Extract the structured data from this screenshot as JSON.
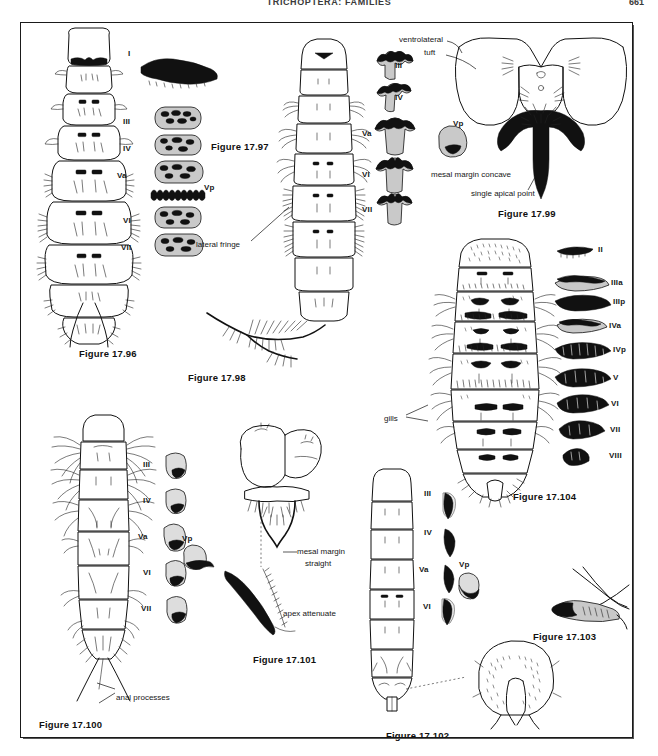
{
  "page": {
    "running_head": "TRICHOPTERA: FAMILIES",
    "folio": "661"
  },
  "figures": [
    {
      "id": "f1796",
      "label": "Figure 17.96"
    },
    {
      "id": "f1797",
      "label": "Figure 17.97"
    },
    {
      "id": "f1798",
      "label": "Figure 17.98"
    },
    {
      "id": "f1799",
      "label": "Figure 17.99"
    },
    {
      "id": "f17100",
      "label": "Figure 17.100"
    },
    {
      "id": "f17101",
      "label": "Figure 17.101"
    },
    {
      "id": "f17102",
      "label": "Figure 17.102"
    },
    {
      "id": "f17103",
      "label": "Figure 17.103"
    },
    {
      "id": "f17104",
      "label": "Figure 17.104"
    }
  ],
  "plate_1796": {
    "figure_label": "Figure 17.96",
    "segment_labels": [
      "I",
      "III",
      "IV",
      "Va",
      "Vp",
      "VI",
      "VII"
    ]
  },
  "plate_1797": {
    "figure_label": "Figure 17.97",
    "callout_lateral_fringe": "lateral fringe",
    "segment_labels": [
      "III",
      "IV",
      "Va",
      "Vp",
      "VI",
      "VII"
    ]
  },
  "plate_1798": {
    "figure_label": "Figure 17.98"
  },
  "plate_1799": {
    "figure_label": "Figure 17.99",
    "callout_tuft_line1": "ventrolateral",
    "callout_tuft_line2": "tuft",
    "callout_mesal": "mesal margin concave",
    "callout_apical": "single apical point"
  },
  "plate_17100": {
    "figure_label": "Figure 17.100",
    "callout_anal": "anal processes",
    "segment_labels": [
      "III",
      "IV",
      "Va",
      "Vp",
      "VI",
      "VII"
    ]
  },
  "plate_17101": {
    "figure_label": "Figure 17.101",
    "callout_mesal_line1": "mesal margin",
    "callout_mesal_line2": "straight",
    "callout_apex": "apex attenuate"
  },
  "plate_17102": {
    "figure_label": "Figure 17.102",
    "segment_labels": [
      "III",
      "IV",
      "Va",
      "Vp",
      "VI"
    ]
  },
  "plate_17103": {
    "figure_label": "Figure 17.103"
  },
  "plate_17104": {
    "figure_label": "Figure 17.104",
    "callout_gills": "gills",
    "segment_labels": [
      "II",
      "IIIa",
      "IIIp",
      "IVa",
      "IVp",
      "V",
      "VI",
      "VII",
      "VIII"
    ]
  }
}
